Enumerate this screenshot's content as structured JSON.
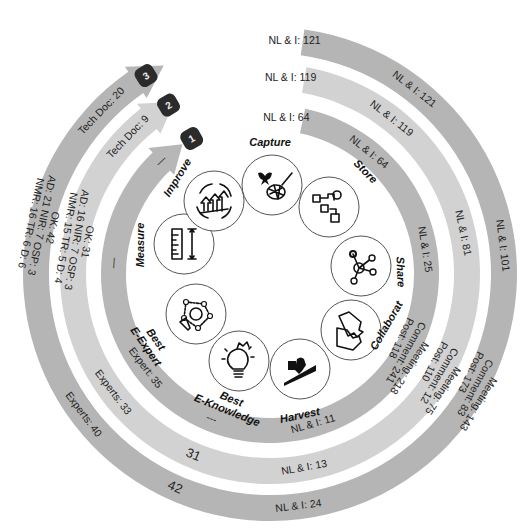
{
  "diagram": {
    "type": "circular-cycle",
    "rings": [
      {
        "id": 1,
        "badge": "1",
        "color": "#b7b7b7",
        "labels": [
          {
            "text": "NL & I: 64",
            "angle": -84,
            "kind": "start"
          },
          {
            "text": "NL & I: 64",
            "angle": -51
          },
          {
            "text": "NL & I: 25",
            "angle": -9
          },
          {
            "text": "Post: 118",
            "angle": 26,
            "group": "collab"
          },
          {
            "text": "Comment: 241",
            "angle": 30,
            "group": "collab"
          },
          {
            "text": "Meeting: 218",
            "angle": 34,
            "group": "collab"
          },
          {
            "text": "NL & I: 11",
            "angle": 74
          },
          {
            "text": "---",
            "angle": 112
          },
          {
            "text": "Expert: 35",
            "angle": 143
          },
          {
            "text": "—",
            "angle": 184
          },
          {
            "text": "—",
            "angle": 226
          }
        ]
      },
      {
        "id": 2,
        "badge": "2",
        "color": "#d2d2d2",
        "labels": [
          {
            "text": "NL & I: 119",
            "angle": -84,
            "kind": "start"
          },
          {
            "text": "NL & I: 119",
            "angle": -52
          },
          {
            "text": "NL & I: 81",
            "angle": -12
          },
          {
            "text": "Post: 110",
            "angle": 28,
            "group": "collab"
          },
          {
            "text": "Comment: 12",
            "angle": 31,
            "group": "collab"
          },
          {
            "text": "Meeting: 75",
            "angle": 34,
            "group": "collab"
          },
          {
            "text": "NL & I: 13",
            "angle": 80
          },
          {
            "text": "31",
            "angle": 113,
            "big": true
          },
          {
            "text": "Experts: 33",
            "angle": 143
          },
          {
            "text": "OK: 31",
            "angle": 190,
            "group": "tech"
          },
          {
            "text": "AD: 16 NIR: 7 OSP: 3",
            "angle": 190,
            "group": "tech"
          },
          {
            "text": "NMR: 15  TR: 5 D: 4",
            "angle": 190,
            "group": "tech"
          },
          {
            "text": "Tech Doc: 9",
            "angle": 224
          }
        ]
      },
      {
        "id": 3,
        "badge": "3",
        "color": "#b5b5b5",
        "labels": [
          {
            "text": "NL & I: 121",
            "angle": -84,
            "kind": "start"
          },
          {
            "text": "NL & I: 121",
            "angle": -52
          },
          {
            "text": "NL & I: 101",
            "angle": -7
          },
          {
            "text": "Post: 173",
            "angle": 26,
            "group": "collab"
          },
          {
            "text": "Comment: 83",
            "angle": 29,
            "group": "collab"
          },
          {
            "text": "Meeting: 143",
            "angle": 32,
            "group": "collab"
          },
          {
            "text": "NL & I: 24",
            "angle": 83
          },
          {
            "text": "42",
            "angle": 114,
            "big": true
          },
          {
            "text": "Experts: 40",
            "angle": 143
          },
          {
            "text": "OK: 42",
            "angle": 192,
            "group": "tech"
          },
          {
            "text": "AD: 21 NIR: 7 OSP: 3",
            "angle": 192,
            "group": "tech"
          },
          {
            "text": "NMR: 16  TR: 6 D: 6",
            "angle": 192,
            "group": "tech"
          },
          {
            "text": "Tech Doc: 20",
            "angle": 224
          }
        ]
      }
    ],
    "stages": [
      {
        "name": "Capture",
        "icon": "butterfly-net-icon"
      },
      {
        "name": "Store",
        "icon": "storage-blocks-icon"
      },
      {
        "name": "Share",
        "icon": "share-nodes-icon"
      },
      {
        "name": "Collaborat",
        "icon": "puzzle-documents-icon"
      },
      {
        "name": "Harvest",
        "icon": "harvest-climb-icon"
      },
      {
        "name": "Best E-Knowledge",
        "line1": "Best",
        "line2": "E-Knowledge",
        "icon": "lightbulb-icon"
      },
      {
        "name": "Best E-Expert",
        "line1": "Best",
        "line2": "E-Expert",
        "icon": "expert-network-icon"
      },
      {
        "name": "Measure",
        "icon": "ruler-icon"
      },
      {
        "name": "Improve",
        "icon": "improve-cycle-icon"
      }
    ],
    "colors": {
      "badge": "#2b2b2b",
      "text": "#222222"
    }
  }
}
